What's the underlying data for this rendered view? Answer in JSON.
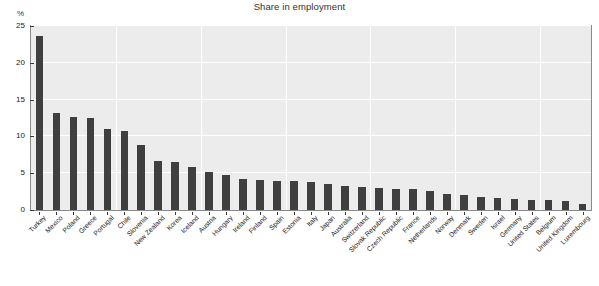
{
  "chart_data": {
    "type": "bar",
    "title": "Share in employment",
    "xlabel": "",
    "ylabel": "%",
    "ylim": [
      0,
      25
    ],
    "yticks": [
      0,
      5,
      10,
      15,
      20,
      25
    ],
    "grid": true,
    "legend": null,
    "bar_color": "#3f3f3f",
    "plot_background": "#ececec",
    "gridline_color": "#ffffff",
    "categories": [
      "Turkey",
      "Mexico",
      "Poland",
      "Greece",
      "Portugal",
      "Chile",
      "Slovenia",
      "New Zealand",
      "Korea",
      "Iceland",
      "Austria",
      "Hungary",
      "Ireland",
      "Finland",
      "Spain",
      "Estonia",
      "Italy",
      "Japan",
      "Australia",
      "Switzerland",
      "Slovak Republic",
      "Czech Republic",
      "France",
      "Netherlands",
      "Norway",
      "Denmark",
      "Sweden",
      "Israel",
      "Germany",
      "United States",
      "Belgium",
      "United Kingdom",
      "Luxembourg"
    ],
    "values": [
      23.7,
      13.2,
      12.7,
      12.5,
      11.0,
      10.7,
      8.8,
      6.6,
      6.5,
      5.8,
      5.2,
      4.7,
      4.2,
      4.1,
      4.0,
      4.0,
      3.8,
      3.6,
      3.2,
      3.1,
      3.0,
      2.9,
      2.8,
      2.6,
      2.2,
      2.0,
      1.8,
      1.6,
      1.5,
      1.4,
      1.3,
      1.2,
      0.8
    ]
  }
}
